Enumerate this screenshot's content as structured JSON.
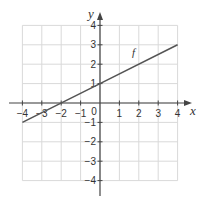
{
  "chart_data": {
    "type": "line",
    "title": "",
    "xlabel": "x",
    "ylabel": "y",
    "xlim": [
      -4,
      4
    ],
    "ylim": [
      -4,
      4
    ],
    "grid": true,
    "xticks": [
      -4,
      -3,
      -2,
      -1,
      0,
      1,
      2,
      3,
      4
    ],
    "yticks": [
      -4,
      -3,
      -2,
      -1,
      1,
      2,
      3,
      4
    ],
    "xtick_labels": [
      "−4",
      "−3",
      "−2",
      "−1",
      "0",
      "1",
      "2",
      "3",
      "4"
    ],
    "ytick_labels": [
      "−4",
      "−3",
      "−2",
      "−1",
      "1",
      "2",
      "3",
      "4"
    ],
    "origin_label": "0",
    "series": [
      {
        "name": "f",
        "equation": "f(x) = 0.5x + 1",
        "x": [
          -4,
          0,
          4
        ],
        "y": [
          -1,
          1,
          3
        ],
        "color": "#555555"
      }
    ],
    "annotations": [
      {
        "text": "f",
        "x": 1.65,
        "y": 2.4
      }
    ]
  },
  "colors": {
    "grid": "#d9d9d9",
    "axis": "#444444",
    "line": "#555555",
    "text": "#333333"
  }
}
